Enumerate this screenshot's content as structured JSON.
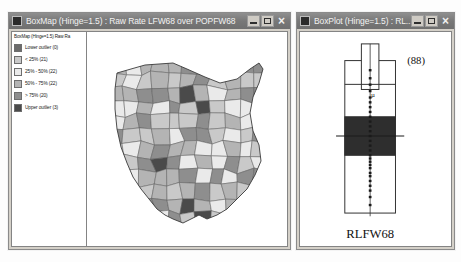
{
  "app": {
    "name": "GeoDa spatial analysis",
    "background_color": "#fdfdfd"
  },
  "boxmap_window": {
    "title": "BoxMap (Hinge=1.5) : Raw Rate LFW68 over POPFW68",
    "titlebar_color": "#787878",
    "icon": "window-system-icon",
    "buttons": {
      "minimize": "_",
      "maximize": "□",
      "close": "×"
    },
    "legend": {
      "title": "BoxMap (Hinge=1.5)   Raw Ra",
      "items": [
        {
          "label": "Lower outlier (0)",
          "color": "#6b6b6b",
          "count": 0
        },
        {
          "label": "< 25% (21)",
          "color": "#c9c9c9",
          "count": 21
        },
        {
          "label": "25% - 50% (22)",
          "color": "#eaeaea",
          "count": 22
        },
        {
          "label": "50% - 75% (22)",
          "color": "#b4b4b4",
          "count": 22
        },
        {
          "label": "> 75% (20)",
          "color": "#8e8e8e",
          "count": 20
        },
        {
          "label": "Upper outlier (3)",
          "color": "#4a4a4a",
          "count": 3
        }
      ]
    },
    "map": {
      "name": "ohio-county-choropleth",
      "region": "Ohio",
      "variable": "Raw Rate LFW68 over POPFW68"
    }
  },
  "boxplot_window": {
    "title": "BoxPlot (Hinge=1.5) : RL...",
    "titlebar_color": "#787878",
    "buttons": {
      "minimize": "_",
      "maximize": "□",
      "close": "×"
    },
    "chart_data": {
      "type": "box",
      "title": "",
      "variable_label": "RLFW68",
      "observation_label": "(88)",
      "n": 88,
      "xlabel": "RLFW68",
      "ylabel": "",
      "hinge": 1.5,
      "box_fill_color": "#2e2e2e",
      "outline_color": "#303030",
      "stats": {
        "min_whisker": 0.02,
        "q1": 0.38,
        "median": 0.5,
        "q3": 0.62,
        "max_whisker": 0.97
      },
      "axis_range": [
        0,
        1
      ],
      "grid": false,
      "legend_position": "none",
      "points": [
        0.07,
        0.12,
        0.16,
        0.19,
        0.22,
        0.25,
        0.27,
        0.3,
        0.32,
        0.34,
        0.36,
        0.38,
        0.41,
        0.44,
        0.47,
        0.5,
        0.53,
        0.56,
        0.59,
        0.62,
        0.65,
        0.68,
        0.71,
        0.74,
        0.78,
        0.82,
        0.86,
        0.91
      ]
    }
  }
}
